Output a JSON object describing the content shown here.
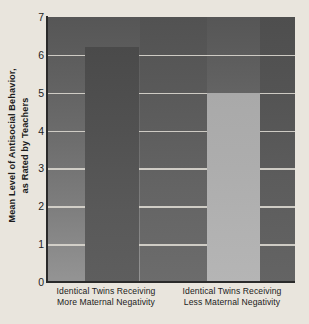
{
  "chart_data": {
    "type": "bar",
    "title": "",
    "subtitle": "",
    "xlabel": "",
    "ylabel": "Mean Level of Antisocial Behavior, as Rated by Teachers",
    "ylabel_lines": [
      "Mean Level of Antisocial Behavior,",
      "as Rated by Teachers"
    ],
    "categories": [
      "Identical Twins Receiving More Maternal Negativity",
      "Identical Twins Receiving Less Maternal Negativity"
    ],
    "category_lines": [
      [
        "Identical Twins Receiving",
        "More Maternal Negativity"
      ],
      [
        "Identical Twins Receiving",
        "Less Maternal Negativity"
      ]
    ],
    "values": [
      6.2,
      5.0
    ],
    "ylim": [
      0,
      7
    ],
    "yticks": [
      0,
      1,
      2,
      3,
      4,
      5,
      6,
      7
    ],
    "ytick_labels": [
      "0",
      "1",
      "2",
      "3",
      "4",
      "5",
      "6",
      "7"
    ],
    "grid": true,
    "grid_axis": "y",
    "grid_color": "#d8d5cd",
    "legend": false,
    "legend_position": "none",
    "bar_colors": [
      "#515151",
      "#b0b0b0"
    ],
    "plot_background": "#6e6e6e",
    "page_background": "#e9e5dd",
    "axis_color": "#2a2a2a"
  }
}
